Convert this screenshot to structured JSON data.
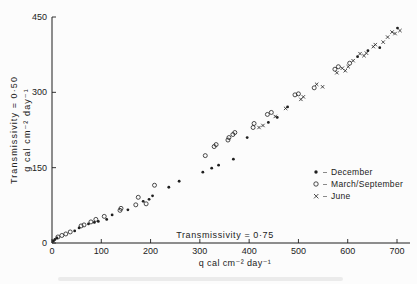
{
  "figure": {
    "background": "#fcfcfc",
    "ink": "#1f1f1f"
  },
  "chart_data": {
    "type": "scatter",
    "title": "",
    "xlabel": "q cal cm⁻² day⁻¹",
    "ylabel_line1": "Transmissivity = 0·50",
    "ylabel_line2": "g cal cm⁻² day⁻¹",
    "annotation": "Transmissivity = 0·75",
    "xlim": [
      0,
      725
    ],
    "ylim": [
      0,
      450
    ],
    "x_ticks": [
      0,
      100,
      200,
      300,
      400,
      500,
      600,
      700
    ],
    "y_ticks": [
      0,
      150,
      300,
      450
    ],
    "grid": false,
    "legend_position": "right-middle",
    "series": [
      {
        "name": "December",
        "marker": "filled-circle",
        "points": [
          [
            3,
            4
          ],
          [
            6,
            7
          ],
          [
            10,
            10
          ],
          [
            46,
            24
          ],
          [
            55,
            30
          ],
          [
            74,
            38
          ],
          [
            86,
            41
          ],
          [
            94,
            43
          ],
          [
            111,
            47
          ],
          [
            122,
            56
          ],
          [
            154,
            66
          ],
          [
            185,
            83
          ],
          [
            197,
            87
          ],
          [
            204,
            94
          ],
          [
            237,
            111
          ],
          [
            258,
            123
          ],
          [
            306,
            141
          ],
          [
            324,
            149
          ],
          [
            338,
            155
          ],
          [
            368,
            167
          ],
          [
            396,
            210
          ],
          [
            439,
            240
          ],
          [
            457,
            250
          ],
          [
            478,
            271
          ],
          [
            620,
            371
          ],
          [
            641,
            383
          ],
          [
            665,
            389
          ],
          [
            701,
            428
          ]
        ]
      },
      {
        "name": "March/September",
        "marker": "open-circle",
        "points": [
          [
            12,
            12
          ],
          [
            20,
            15
          ],
          [
            28,
            18
          ],
          [
            37,
            22
          ],
          [
            59,
            34
          ],
          [
            65,
            36
          ],
          [
            79,
            42
          ],
          [
            89,
            47
          ],
          [
            106,
            53
          ],
          [
            138,
            65
          ],
          [
            140,
            69
          ],
          [
            170,
            76
          ],
          [
            175,
            91
          ],
          [
            191,
            78
          ],
          [
            208,
            115
          ],
          [
            311,
            174
          ],
          [
            329,
            192
          ],
          [
            333,
            196
          ],
          [
            357,
            205
          ],
          [
            359,
            210
          ],
          [
            367,
            216
          ],
          [
            371,
            220
          ],
          [
            408,
            230
          ],
          [
            410,
            238
          ],
          [
            437,
            256
          ],
          [
            445,
            260
          ],
          [
            493,
            295
          ],
          [
            500,
            297
          ],
          [
            532,
            309
          ],
          [
            574,
            346
          ],
          [
            581,
            351
          ],
          [
            604,
            358
          ]
        ]
      },
      {
        "name": "June",
        "marker": "x-cross",
        "points": [
          [
            420,
            230
          ],
          [
            428,
            234
          ],
          [
            453,
            252
          ],
          [
            474,
            268
          ],
          [
            505,
            286
          ],
          [
            510,
            291
          ],
          [
            537,
            316
          ],
          [
            549,
            311
          ],
          [
            578,
            339
          ],
          [
            589,
            348
          ],
          [
            595,
            343
          ],
          [
            601,
            351
          ],
          [
            611,
            363
          ],
          [
            625,
            377
          ],
          [
            633,
            373
          ],
          [
            638,
            378
          ],
          [
            652,
            391
          ],
          [
            656,
            395
          ],
          [
            672,
            400
          ],
          [
            681,
            410
          ],
          [
            690,
            420
          ],
          [
            696,
            417
          ],
          [
            706,
            423
          ]
        ]
      }
    ]
  }
}
